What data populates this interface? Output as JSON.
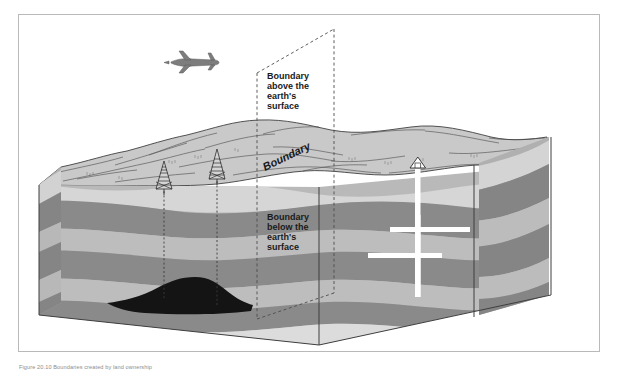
{
  "figure": {
    "caption": "Figure 20.10 Boundaries created by land ownership"
  },
  "labels": {
    "boundary_surface": "Boundary",
    "boundary_above": [
      "Boundary",
      "above the",
      "earth's",
      "surface"
    ],
    "boundary_below": [
      "Boundary",
      "below the",
      "earth's",
      "surface"
    ]
  },
  "icons": {
    "airplane": "airplane-icon",
    "derrick_left": "drilling-derrick-icon",
    "derrick_right": "drilling-derrick-icon",
    "wellhead": "wellhead-icon",
    "deposit": "oil-deposit-shape",
    "boundary_plane": "boundary-plane-shape",
    "well_bore": "well-bore-shape"
  },
  "colors": {
    "frame_border": "#b9b9b9",
    "terrain_fill": "#c9c9c9",
    "terrain_line": "#4a4a4a",
    "strata_dark": "#8a8a8a",
    "strata_light": "#b9b9b9",
    "strata_pale": "#d8d8d8",
    "deposit": "#111111",
    "well_white": "#ffffff",
    "dashed_line": "#555555",
    "label_text": "#1a1a1a",
    "caption_text": "#8d8d8d"
  },
  "geometry": {
    "frame": {
      "x": 18,
      "y": 14,
      "w": 582,
      "h": 338
    },
    "plane_apex": {
      "x": 333,
      "y": 27
    },
    "plane_bottom_left": {
      "x": 258,
      "y": 318
    },
    "well_head": {
      "x": 417,
      "y": 170
    },
    "well_depth": {
      "x": 417,
      "y": 295
    }
  }
}
